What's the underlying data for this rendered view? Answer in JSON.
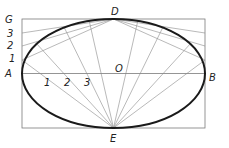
{
  "diagram": {
    "labels": {
      "G": "G",
      "D": "D",
      "A": "A",
      "B": "B",
      "E": "E",
      "O": "O",
      "left1": "1",
      "left2": "2",
      "left3": "3",
      "axis1": "1",
      "axis2": "2",
      "axis3": "3"
    },
    "geometry": {
      "rect": {
        "x1": 22,
        "y1": 19,
        "x2": 205,
        "y2": 128
      },
      "center": {
        "x": 113.5,
        "y": 73.5
      },
      "major_axis_label": "AB",
      "minor_axis_label": "DE"
    },
    "colors": {
      "curve": "#1a1a1a",
      "construction": "#8a8a8a",
      "frame": "#7a7a7a"
    }
  }
}
